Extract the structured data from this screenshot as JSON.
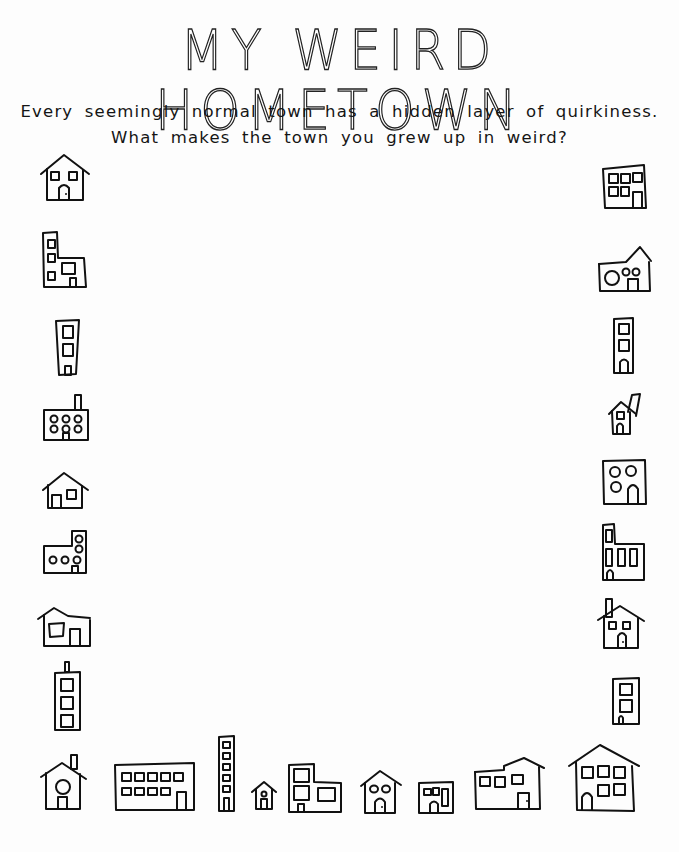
{
  "worksheet": {
    "title": "MY WEIRD HOMETOWN",
    "prompt_line1": "Every seemingly normal town has a hidden layer of quirkiness.",
    "prompt_line2": "What makes the town you grew up in weird?"
  },
  "border_drawings": {
    "left_column": [
      "house-two-windows-arched-door",
      "tall-building-with-annex",
      "narrow-tower",
      "factory-with-chimney-six-round-windows",
      "small-house",
      "l-shaped-building-round-windows",
      "house-with-side-wing",
      "tower-with-antenna"
    ],
    "right_column": [
      "apartment-block",
      "house-with-round-windows",
      "narrow-tower",
      "tiny-house-with-chimney",
      "square-building-round-windows",
      "building-with-tall-windows",
      "house-with-chimney",
      "small-tower"
    ],
    "bottom_row": [
      "house-with-chimney-round-window",
      "long-building-ten-windows",
      "skinny-tower",
      "tiny-house",
      "stepped-building",
      "house-round-windows",
      "small-shop",
      "split-level-house",
      "big-house"
    ]
  },
  "colors": {
    "ink": "#111111",
    "paper": "#fdfdfd"
  }
}
